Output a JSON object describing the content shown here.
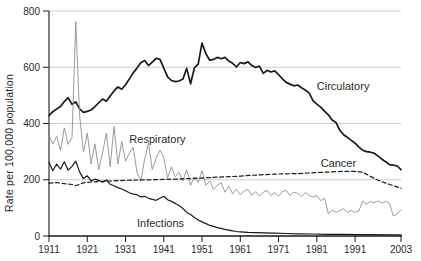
{
  "colors": {
    "background": "#ffffff",
    "axis": "#1a1a1a",
    "grid": "#c9c9c9",
    "text": "#2b2b2b",
    "respiratory_line": "#8f8f8f",
    "dark_line": "#1a1a1a"
  },
  "chart_data": {
    "type": "line",
    "title": "",
    "xlabel": "",
    "ylabel": "Rate per 100,000 population",
    "xlim": [
      1911,
      2003
    ],
    "ylim": [
      0,
      800
    ],
    "grid": "horizontal",
    "legend_position": "inline-annotations",
    "yticks": [
      0,
      200,
      400,
      600,
      800
    ],
    "xticks": [
      {
        "label": "1911",
        "year": 1911
      },
      {
        "label": "1921",
        "year": 1921
      },
      {
        "label": "1931",
        "year": 1931
      },
      {
        "label": "1941",
        "year": 1941
      },
      {
        "label": "1951",
        "year": 1951
      },
      {
        "label": "1961",
        "year": 1961
      },
      {
        "label": "1971",
        "year": 1971
      },
      {
        "label": "1981",
        "year": 1981
      },
      {
        "label": "1991",
        "year": 1991
      },
      {
        "label": "2003",
        "year": 2003
      }
    ],
    "series": [
      {
        "name": "Circulatory",
        "style": "solid",
        "color": "#1a1a1a",
        "width": 1.7,
        "points": [
          [
            1911,
            428
          ],
          [
            1912,
            442
          ],
          [
            1913,
            452
          ],
          [
            1914,
            460
          ],
          [
            1915,
            478
          ],
          [
            1916,
            492
          ],
          [
            1917,
            468
          ],
          [
            1918,
            477
          ],
          [
            1919,
            452
          ],
          [
            1920,
            440
          ],
          [
            1921,
            443
          ],
          [
            1922,
            448
          ],
          [
            1923,
            460
          ],
          [
            1925,
            487
          ],
          [
            1926,
            479
          ],
          [
            1927,
            498
          ],
          [
            1928,
            516
          ],
          [
            1929,
            530
          ],
          [
            1930,
            522
          ],
          [
            1931,
            538
          ],
          [
            1932,
            558
          ],
          [
            1933,
            580
          ],
          [
            1934,
            597
          ],
          [
            1935,
            616
          ],
          [
            1936,
            624
          ],
          [
            1937,
            606
          ],
          [
            1938,
            618
          ],
          [
            1939,
            632
          ],
          [
            1940,
            628
          ],
          [
            1941,
            597
          ],
          [
            1942,
            566
          ],
          [
            1943,
            553
          ],
          [
            1944,
            549
          ],
          [
            1945,
            551
          ],
          [
            1946,
            558
          ],
          [
            1947,
            596
          ],
          [
            1948,
            541
          ],
          [
            1949,
            598
          ],
          [
            1950,
            611
          ],
          [
            1951,
            686
          ],
          [
            1952,
            648
          ],
          [
            1953,
            625
          ],
          [
            1954,
            628
          ],
          [
            1955,
            635
          ],
          [
            1956,
            630
          ],
          [
            1957,
            635
          ],
          [
            1958,
            622
          ],
          [
            1959,
            614
          ],
          [
            1960,
            601
          ],
          [
            1961,
            617
          ],
          [
            1962,
            613
          ],
          [
            1963,
            619
          ],
          [
            1964,
            606
          ],
          [
            1965,
            599
          ],
          [
            1966,
            604
          ],
          [
            1967,
            578
          ],
          [
            1968,
            589
          ],
          [
            1969,
            583
          ],
          [
            1970,
            587
          ],
          [
            1971,
            574
          ],
          [
            1972,
            559
          ],
          [
            1973,
            546
          ],
          [
            1974,
            540
          ],
          [
            1975,
            534
          ],
          [
            1976,
            537
          ],
          [
            1977,
            527
          ],
          [
            1978,
            519
          ],
          [
            1979,
            508
          ],
          [
            1980,
            481
          ],
          [
            1981,
            469
          ],
          [
            1982,
            458
          ],
          [
            1983,
            444
          ],
          [
            1984,
            431
          ],
          [
            1985,
            412
          ],
          [
            1986,
            404
          ],
          [
            1987,
            376
          ],
          [
            1988,
            360
          ],
          [
            1989,
            351
          ],
          [
            1990,
            340
          ],
          [
            1991,
            330
          ],
          [
            1992,
            316
          ],
          [
            1993,
            305
          ],
          [
            1994,
            300
          ],
          [
            1995,
            298
          ],
          [
            1996,
            294
          ],
          [
            1997,
            284
          ],
          [
            1998,
            273
          ],
          [
            1999,
            264
          ],
          [
            2000,
            254
          ],
          [
            2001,
            252
          ],
          [
            2002,
            249
          ],
          [
            2003,
            236
          ]
        ]
      },
      {
        "name": "Respiratory",
        "style": "solid",
        "color": "#8f8f8f",
        "width": 0.9,
        "points": [
          [
            1911,
            358
          ],
          [
            1912,
            328
          ],
          [
            1913,
            354
          ],
          [
            1914,
            304
          ],
          [
            1915,
            384
          ],
          [
            1916,
            326
          ],
          [
            1917,
            350
          ],
          [
            1918,
            762
          ],
          [
            1919,
            430
          ],
          [
            1920,
            298
          ],
          [
            1921,
            366
          ],
          [
            1922,
            256
          ],
          [
            1923,
            328
          ],
          [
            1924,
            236
          ],
          [
            1925,
            296
          ],
          [
            1926,
            366
          ],
          [
            1927,
            246
          ],
          [
            1928,
            390
          ],
          [
            1929,
            256
          ],
          [
            1930,
            336
          ],
          [
            1931,
            266
          ],
          [
            1932,
            294
          ],
          [
            1933,
            316
          ],
          [
            1934,
            226
          ],
          [
            1935,
            196
          ],
          [
            1936,
            274
          ],
          [
            1937,
            330
          ],
          [
            1938,
            236
          ],
          [
            1939,
            276
          ],
          [
            1940,
            306
          ],
          [
            1941,
            278
          ],
          [
            1942,
            206
          ],
          [
            1943,
            246
          ],
          [
            1944,
            210
          ],
          [
            1945,
            226
          ],
          [
            1946,
            196
          ],
          [
            1947,
            236
          ],
          [
            1948,
            180
          ],
          [
            1949,
            210
          ],
          [
            1950,
            190
          ],
          [
            1951,
            232
          ],
          [
            1952,
            180
          ],
          [
            1953,
            196
          ],
          [
            1954,
            166
          ],
          [
            1955,
            180
          ],
          [
            1956,
            190
          ],
          [
            1957,
            156
          ],
          [
            1958,
            176
          ],
          [
            1959,
            150
          ],
          [
            1960,
            166
          ],
          [
            1961,
            146
          ],
          [
            1962,
            160
          ],
          [
            1963,
            166
          ],
          [
            1964,
            144
          ],
          [
            1965,
            158
          ],
          [
            1966,
            142
          ],
          [
            1967,
            156
          ],
          [
            1968,
            162
          ],
          [
            1969,
            144
          ],
          [
            1970,
            154
          ],
          [
            1971,
            142
          ],
          [
            1972,
            158
          ],
          [
            1973,
            162
          ],
          [
            1974,
            144
          ],
          [
            1975,
            156
          ],
          [
            1976,
            152
          ],
          [
            1977,
            140
          ],
          [
            1978,
            154
          ],
          [
            1979,
            144
          ],
          [
            1980,
            138
          ],
          [
            1981,
            144
          ],
          [
            1982,
            126
          ],
          [
            1983,
            134
          ],
          [
            1984,
            80
          ],
          [
            1985,
            92
          ],
          [
            1986,
            84
          ],
          [
            1987,
            90
          ],
          [
            1988,
            97
          ],
          [
            1989,
            84
          ],
          [
            1990,
            91
          ],
          [
            1991,
            84
          ],
          [
            1992,
            89
          ],
          [
            1993,
            124
          ],
          [
            1994,
            113
          ],
          [
            1995,
            123
          ],
          [
            1996,
            118
          ],
          [
            1997,
            124
          ],
          [
            1998,
            117
          ],
          [
            1999,
            123
          ],
          [
            2000,
            116
          ],
          [
            2001,
            71
          ],
          [
            2002,
            79
          ],
          [
            2003,
            94
          ]
        ]
      },
      {
        "name": "Cancer",
        "style": "dashed",
        "color": "#1a1a1a",
        "width": 1.2,
        "points": [
          [
            1911,
            188
          ],
          [
            1913,
            190
          ],
          [
            1915,
            186
          ],
          [
            1917,
            183
          ],
          [
            1918,
            179
          ],
          [
            1920,
            189
          ],
          [
            1922,
            192
          ],
          [
            1925,
            194
          ],
          [
            1928,
            196
          ],
          [
            1931,
            198
          ],
          [
            1934,
            199
          ],
          [
            1937,
            200
          ],
          [
            1940,
            201
          ],
          [
            1943,
            202
          ],
          [
            1946,
            203
          ],
          [
            1949,
            205
          ],
          [
            1952,
            207
          ],
          [
            1955,
            209
          ],
          [
            1958,
            211
          ],
          [
            1961,
            213
          ],
          [
            1964,
            216
          ],
          [
            1967,
            218
          ],
          [
            1970,
            220
          ],
          [
            1973,
            221
          ],
          [
            1976,
            222
          ],
          [
            1979,
            224
          ],
          [
            1982,
            226
          ],
          [
            1985,
            228
          ],
          [
            1988,
            230
          ],
          [
            1991,
            230
          ],
          [
            1993,
            227
          ],
          [
            1995,
            212
          ],
          [
            1997,
            198
          ],
          [
            1999,
            188
          ],
          [
            2001,
            179
          ],
          [
            2003,
            170
          ]
        ]
      },
      {
        "name": "Infections",
        "style": "solid",
        "color": "#1a1a1a",
        "width": 1.2,
        "points": [
          [
            1911,
            262
          ],
          [
            1912,
            232
          ],
          [
            1913,
            256
          ],
          [
            1914,
            238
          ],
          [
            1915,
            264
          ],
          [
            1916,
            234
          ],
          [
            1917,
            248
          ],
          [
            1918,
            266
          ],
          [
            1919,
            228
          ],
          [
            1920,
            204
          ],
          [
            1921,
            214
          ],
          [
            1922,
            196
          ],
          [
            1923,
            202
          ],
          [
            1924,
            198
          ],
          [
            1925,
            191
          ],
          [
            1926,
            199
          ],
          [
            1927,
            184
          ],
          [
            1928,
            179
          ],
          [
            1929,
            172
          ],
          [
            1930,
            167
          ],
          [
            1931,
            161
          ],
          [
            1932,
            154
          ],
          [
            1933,
            149
          ],
          [
            1934,
            147
          ],
          [
            1935,
            139
          ],
          [
            1936,
            141
          ],
          [
            1937,
            134
          ],
          [
            1938,
            130
          ],
          [
            1939,
            127
          ],
          [
            1940,
            134
          ],
          [
            1941,
            141
          ],
          [
            1942,
            129
          ],
          [
            1943,
            123
          ],
          [
            1944,
            116
          ],
          [
            1945,
            108
          ],
          [
            1946,
            98
          ],
          [
            1947,
            84
          ],
          [
            1948,
            76
          ],
          [
            1949,
            66
          ],
          [
            1950,
            57
          ],
          [
            1951,
            50
          ],
          [
            1952,
            44
          ],
          [
            1953,
            38
          ],
          [
            1954,
            34
          ],
          [
            1955,
            30
          ],
          [
            1956,
            27
          ],
          [
            1957,
            24
          ],
          [
            1958,
            21
          ],
          [
            1959,
            18
          ],
          [
            1960,
            16
          ],
          [
            1961,
            15
          ],
          [
            1963,
            13
          ],
          [
            1965,
            12
          ],
          [
            1967,
            11
          ],
          [
            1970,
            10
          ],
          [
            1973,
            9
          ],
          [
            1976,
            8
          ],
          [
            1980,
            7
          ],
          [
            1984,
            6
          ],
          [
            1988,
            6
          ],
          [
            1992,
            5
          ],
          [
            1996,
            5
          ],
          [
            2000,
            4
          ],
          [
            2003,
            4
          ]
        ]
      }
    ],
    "annotations": [
      {
        "label": "Circulatory",
        "year": 1981,
        "value": 520
      },
      {
        "label": "Respiratory",
        "year": 1932,
        "value": 330
      },
      {
        "label": "Cancer",
        "year": 1982,
        "value": 245
      },
      {
        "label": "Infections",
        "year": 1934,
        "value": 32
      }
    ]
  }
}
